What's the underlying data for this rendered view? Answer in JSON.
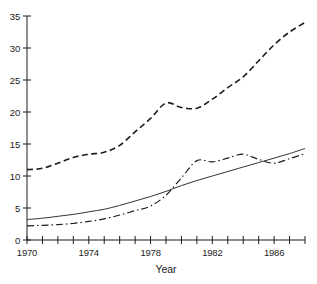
{
  "chart_data": {
    "type": "line",
    "title": "",
    "xlabel": "Year",
    "ylabel": "",
    "xlim": [
      1970,
      1988
    ],
    "ylim": [
      0,
      35
    ],
    "x_tick_step": 1,
    "x_label_ticks": [
      1970,
      1974,
      1978,
      1982,
      1986
    ],
    "y_ticks": [
      0,
      5,
      10,
      15,
      20,
      25,
      30,
      35
    ],
    "grid": false,
    "legend": "none",
    "line_color": "#1c1c1c",
    "x": [
      1970,
      1971,
      1972,
      1973,
      1974,
      1975,
      1976,
      1977,
      1978,
      1979,
      1980,
      1981,
      1982,
      1983,
      1984,
      1985,
      1986,
      1987,
      1988
    ],
    "series": [
      {
        "name": "dashed-series",
        "line_style": "dashed",
        "values": [
          11.0,
          11.2,
          12.0,
          12.9,
          13.4,
          13.7,
          14.8,
          16.9,
          19.0,
          21.4,
          20.7,
          20.6,
          22.0,
          23.8,
          25.5,
          28.0,
          30.5,
          32.5,
          34.0
        ]
      },
      {
        "name": "solid-series",
        "line_style": "solid",
        "values": [
          3.2,
          3.4,
          3.7,
          4.0,
          4.4,
          4.8,
          5.4,
          6.1,
          6.8,
          7.6,
          8.5,
          9.3,
          10.0,
          10.7,
          11.4,
          12.1,
          12.8,
          13.5,
          14.3
        ]
      },
      {
        "name": "dash-dot-series",
        "line_style": "dash-dot",
        "values": [
          2.2,
          2.3,
          2.4,
          2.6,
          2.9,
          3.3,
          3.9,
          4.6,
          5.3,
          7.0,
          9.7,
          12.4,
          12.2,
          12.8,
          13.4,
          12.6,
          12.0,
          12.7,
          13.5
        ]
      }
    ]
  }
}
